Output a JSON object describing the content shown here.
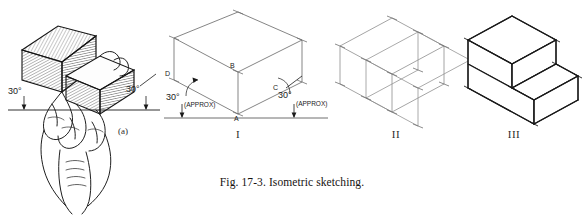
{
  "figure": {
    "caption": "Fig. 17-3. Isometric sketching.",
    "background_color": "#ffffff",
    "ink_color": "#1a1a1a",
    "construction_color": "#8d8d8d"
  },
  "panels": [
    {
      "id": "panel-a",
      "label": "(a)",
      "kind": "pictorial-hand-holding-block",
      "description": "Hand holding a stepped rectangular block tilted so the two receding top edges each slope 30 degrees from horizontal",
      "angles": [
        {
          "value": "30°",
          "side": "left"
        },
        {
          "value": "30°",
          "side": "right"
        }
      ]
    },
    {
      "id": "panel-i",
      "numeral": "I",
      "kind": "isometric-box-with-axes",
      "description": "Enclosing isometric box blocked in from the vertical axis AB and the two 30 degree receding axes AD and AC",
      "vertices": [
        "A",
        "B",
        "C",
        "D"
      ],
      "angles": [
        {
          "value": "30°",
          "note": "(APPROX)",
          "side": "left"
        },
        {
          "value": "30°",
          "note": "(APPROX)",
          "side": "right"
        }
      ]
    },
    {
      "id": "panel-ii",
      "numeral": "II",
      "kind": "isometric-box-with-construction-lines",
      "description": "Same box with light construction lines and tick marks laying out the step cut"
    },
    {
      "id": "panel-iii",
      "numeral": "III",
      "kind": "finished-stepped-solid",
      "description": "Completed stepped block with construction lines removed and visible edges darkened"
    }
  ]
}
